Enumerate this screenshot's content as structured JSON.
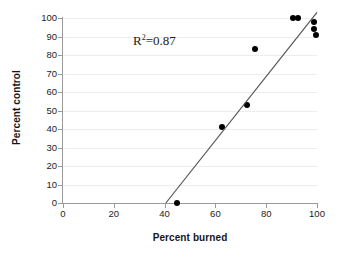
{
  "chart_data": {
    "type": "scatter",
    "title": "",
    "xlabel": "Percent burned",
    "ylabel": "Percent control",
    "xlim": [
      0,
      100
    ],
    "ylim": [
      0,
      100
    ],
    "xticks": [
      0,
      20,
      40,
      60,
      80,
      100
    ],
    "yticks": [
      0,
      10,
      20,
      30,
      40,
      50,
      60,
      70,
      80,
      90,
      100
    ],
    "grid": "horizontal",
    "legend": "none",
    "annotations": [
      {
        "text": "R2=0.87",
        "display_base": "R",
        "display_exponent": "2",
        "display_rest": "=0.87",
        "r_squared": 0.87,
        "x": 28,
        "y": 90
      }
    ],
    "series": [
      {
        "name": "observations",
        "marker": "filled-circle",
        "color": "#000000",
        "points": [
          {
            "x": 45.0,
            "y": 0.0
          },
          {
            "x": 62.5,
            "y": 41.0
          },
          {
            "x": 72.5,
            "y": 53.0
          },
          {
            "x": 75.5,
            "y": 83.5
          },
          {
            "x": 90.5,
            "y": 100.0
          },
          {
            "x": 92.5,
            "y": 100.0
          },
          {
            "x": 99.0,
            "y": 98.0
          },
          {
            "x": 99.0,
            "y": 94.0
          },
          {
            "x": 99.5,
            "y": 91.0
          }
        ]
      }
    ],
    "trendline": {
      "type": "linear",
      "color": "#555555",
      "x_start": 40.5,
      "y_start": 0.0,
      "x_end": 100.0,
      "y_end": 103.0
    }
  },
  "axes": {
    "y_tick_labels": [
      "100",
      "90",
      "80",
      "70",
      "60",
      "50",
      "40",
      "30",
      "20",
      "10",
      "0"
    ],
    "x_tick_labels": [
      "0",
      "20",
      "40",
      "60",
      "80",
      "100"
    ]
  }
}
